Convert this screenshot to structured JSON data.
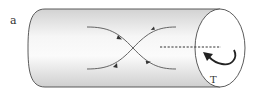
{
  "figure": {
    "panel_label": "a",
    "torque_label": "T",
    "colors": {
      "stroke": "#4a4a4a",
      "shade_dark": "#c8c8c8",
      "shade_light": "#f7f7f7",
      "cap_fill": "#ffffff"
    },
    "elements": [
      "cylinder",
      "crossing-field-lines",
      "axis-dashed-line",
      "rotation-arrow"
    ]
  }
}
